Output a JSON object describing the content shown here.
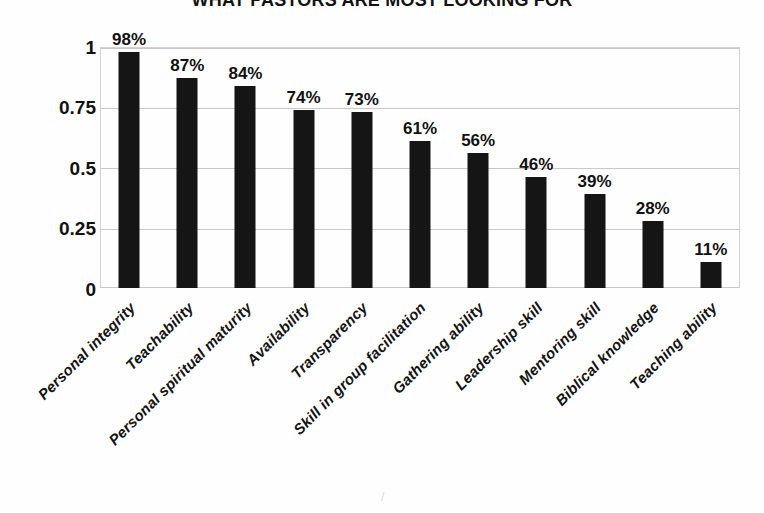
{
  "chart_data": {
    "type": "bar",
    "title": "WHAT PASTORS ARE MOST LOOKING FOR",
    "xlabel": "",
    "ylabel": "",
    "ylim": [
      0,
      1
    ],
    "grid": true,
    "legend": "none",
    "ytick_labels": [
      "1",
      "0.75",
      "0.5",
      "0.25",
      "0"
    ],
    "ytick_values": [
      1,
      0.75,
      0.5,
      0.25,
      0
    ],
    "categories": [
      "Personal integrity",
      "Teachability",
      "Personal spiritual maturity",
      "Availability",
      "Transparency",
      "Skill in group facilitation",
      "Gathering ability",
      "Leadership skill",
      "Mentoring skill",
      "Biblical knowledge",
      "Teaching ability"
    ],
    "values": [
      0.98,
      0.87,
      0.84,
      0.74,
      0.73,
      0.61,
      0.56,
      0.46,
      0.39,
      0.28,
      0.11
    ],
    "data_labels": [
      "98%",
      "87%",
      "84%",
      "74%",
      "73%",
      "61%",
      "56%",
      "46%",
      "39%",
      "28%",
      "11%"
    ],
    "bar_color": "#151515",
    "grid_color": "#c9c9c9",
    "plot_background": "#fefefe"
  },
  "artifact": {
    "mark": "/"
  }
}
